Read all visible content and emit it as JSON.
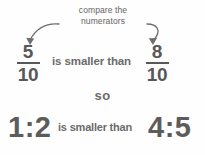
{
  "figure": {
    "background_color": "#fefefe",
    "text_color": "#5c5c5c",
    "caption_color": "#636363"
  },
  "annotation": {
    "line1": "compare the",
    "line2": "numerators",
    "arrow_left_name": "curved-arrow-to-left-numerator",
    "arrow_right_name": "curved-arrow-to-right-numerator"
  },
  "comparison": {
    "left_fraction": {
      "numerator": "5",
      "denominator": "10"
    },
    "right_fraction": {
      "numerator": "8",
      "denominator": "10"
    },
    "relation_text": "is smaller than",
    "connector_word": "so"
  },
  "ratios": {
    "left_ratio": "1:2",
    "right_ratio": "4:5",
    "relation_text": "is smaller than"
  }
}
